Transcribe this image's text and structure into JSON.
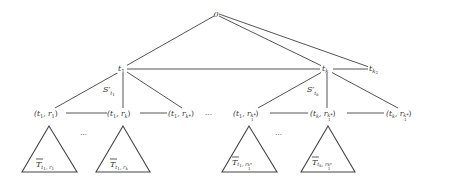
{
  "diagram": {
    "root": {
      "label": "0",
      "x": 216,
      "y": 14
    },
    "level1": [
      {
        "id": "t1",
        "base": "t",
        "sub": "1",
        "x": 122,
        "y": 69
      },
      {
        "id": "tk",
        "base": "t",
        "sub": "k",
        "x": 326,
        "y": 69
      },
      {
        "id": "tk2",
        "base": "t",
        "sub": "k2",
        "x": 376,
        "y": 69
      }
    ],
    "edge_labels": [
      {
        "base": "S'",
        "sub": "t1",
        "x": 104,
        "y": 90
      },
      {
        "base": "S'",
        "sub": "tk",
        "x": 308,
        "y": 90
      }
    ],
    "level2": [
      {
        "label_open": "(t",
        "sub1": "1",
        "mid": ", r",
        "sub2": "1",
        "close": ")",
        "x": 50,
        "y": 113
      },
      {
        "label_open": "(t",
        "sub1": "1",
        "mid": ", r",
        "sub2": "k",
        "close": ")",
        "x": 123,
        "y": 113
      },
      {
        "label_open": "(t",
        "sub1": "1",
        "mid": ", r",
        "sub2": "k*",
        "close": ")",
        "x": 185,
        "y": 113
      },
      {
        "label_open": "(t",
        "sub1": "1",
        "mid": ", r",
        "sub2": "k*1",
        "close": ")",
        "x": 251,
        "y": 113
      },
      {
        "label_open": "(t",
        "sub1": "k",
        "mid": ", r",
        "sub2": "k*1",
        "close": ")",
        "x": 328,
        "y": 113
      },
      {
        "label_open": "(t",
        "sub1": "k",
        "mid": ", r",
        "sub2": "k*1",
        "close": ")",
        "x": 404,
        "y": 113
      }
    ],
    "ellipses": [
      "…",
      "…",
      "…"
    ],
    "subtrees": [
      {
        "label": "T̄",
        "sub": "t1, r1",
        "apex_x": 49
      },
      {
        "label": "T̄",
        "sub": "t1, rk",
        "apex_x": 123
      },
      {
        "label": "T̄",
        "sub": "t1, rk*1",
        "apex_x": 249
      },
      {
        "label": "T̄",
        "sub": "tk, rk*1",
        "apex_x": 328
      }
    ]
  }
}
